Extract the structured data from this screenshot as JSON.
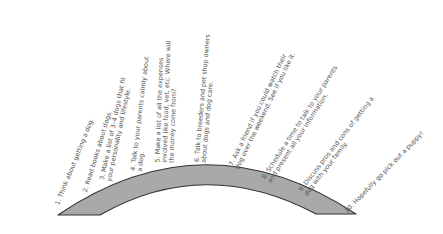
{
  "diagram": {
    "type": "arc-timeline",
    "colors": {
      "arc_fill": "#a9a9a9",
      "arc_stroke": "#333333",
      "text": "#555555"
    },
    "steps": [
      {
        "text": "1. Think about getting a dog.",
        "x": 60,
        "y": 206,
        "angle": -68
      },
      {
        "text": "2. Read books about dogs.",
        "x": 88,
        "y": 193,
        "angle": -73
      },
      {
        "text": "3. Make a list of 3–4 dogs that fit\nyour personality and lifestyle.",
        "x": 112,
        "y": 182,
        "angle": -78
      },
      {
        "text": "4. Talk to your parents calmly about\na dog.",
        "x": 143,
        "y": 172,
        "angle": -83
      },
      {
        "text": "5. Make a list of all the expenses\ninvolved like food, vet, etc. Where will\nthe money come from?",
        "x": 175,
        "y": 163,
        "angle": -88
      },
      {
        "text": "6. Talk to breeders and pet shop owners\nabout dogs and dog care.",
        "x": 207,
        "y": 163,
        "angle": -85
      },
      {
        "text": "7. Ask a friend if you could watch their\ndog over the weekend. See if you like it.",
        "x": 240,
        "y": 170,
        "angle": -64
      },
      {
        "text": "8. Schedule a time to talk to your parents\nand present all your information.",
        "x": 272,
        "y": 184,
        "angle": -57
      },
      {
        "text": "9. Discuss pros and cons of getting a\ndog with your family.",
        "x": 308,
        "y": 197,
        "angle": -52
      },
      {
        "text": "10. Hopefully go pick out a puppy!",
        "x": 348,
        "y": 214,
        "angle": -46
      }
    ]
  }
}
